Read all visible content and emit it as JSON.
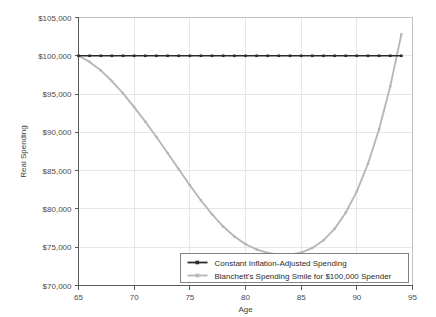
{
  "chart_data": {
    "type": "line",
    "title": "",
    "xlabel": "Age",
    "ylabel": "Real Spending",
    "xlim": [
      65,
      95
    ],
    "ylim": [
      70000,
      105000
    ],
    "grid": true,
    "legend_position": "lower-right",
    "x": [
      65,
      66,
      67,
      68,
      69,
      70,
      71,
      72,
      73,
      74,
      75,
      76,
      77,
      78,
      79,
      80,
      81,
      82,
      83,
      84,
      85,
      86,
      87,
      88,
      89,
      90,
      91,
      92,
      93,
      94
    ],
    "xticks": [
      65,
      70,
      75,
      80,
      85,
      90,
      95
    ],
    "xtick_labels": [
      "65",
      "70",
      "75",
      "80",
      "85",
      "90",
      "95"
    ],
    "yticks": [
      70000,
      75000,
      80000,
      85000,
      90000,
      95000,
      100000,
      105000
    ],
    "ytick_labels": [
      "$70,000",
      "$75,000",
      "$80,000",
      "$85,000",
      "$90,000",
      "$95,000",
      "$100,000",
      "$105,000"
    ],
    "series": [
      {
        "name": "Constant Inflation-Adjusted Spending",
        "color": "#2b2b2b",
        "marker": "square",
        "values": [
          100000,
          100000,
          100000,
          100000,
          100000,
          100000,
          100000,
          100000,
          100000,
          100000,
          100000,
          100000,
          100000,
          100000,
          100000,
          100000,
          100000,
          100000,
          100000,
          100000,
          100000,
          100000,
          100000,
          100000,
          100000,
          100000,
          100000,
          100000,
          100000,
          100000
        ]
      },
      {
        "name": "Blanchett's Spending Smile for $100,000 Spender",
        "color": "#b7b7b7",
        "marker": "square",
        "values": [
          100000,
          99200,
          98100,
          96700,
          95100,
          93300,
          91400,
          89400,
          87300,
          85200,
          83100,
          81100,
          79300,
          77700,
          76400,
          75400,
          74700,
          74250,
          74050,
          74050,
          74300,
          74900,
          75900,
          77400,
          79500,
          82300,
          85900,
          90400,
          96000,
          102800
        ]
      }
    ]
  },
  "legend": {
    "entries": [
      {
        "label": "Constant Inflation-Adjusted Spending",
        "color": "#2b2b2b"
      },
      {
        "label": "Blanchett's Spending Smile for $100,000 Spender",
        "color": "#b7b7b7"
      }
    ]
  }
}
